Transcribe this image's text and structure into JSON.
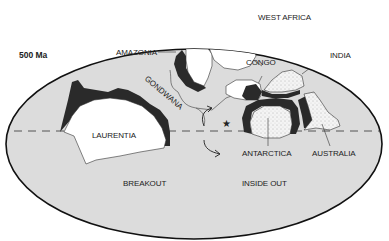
{
  "diagram": {
    "age_label": "500 Ma",
    "continents": {
      "laurentia": "LAURENTIA",
      "amazonia": "AMAZONIA",
      "gondwana": "GONDWANA",
      "west_africa": "WEST AFRICA",
      "congo": "CONGO",
      "india": "INDIA",
      "antarctica": "ANTARCTICA",
      "australia": "AUSTRALIA"
    },
    "scenarios": {
      "left": "BREAKOUT",
      "right": "INSIDE OUT"
    },
    "markers": {
      "star": "★"
    },
    "colors": {
      "ocean": "#dcdcdc",
      "continent": "#ffffff",
      "margin": "#2a2a2a",
      "outline": "#111111"
    }
  }
}
